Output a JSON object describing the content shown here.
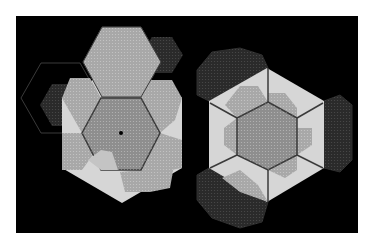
{
  "figure": {
    "background": "#ffffff",
    "panel": {
      "x": 16,
      "y": 16,
      "width": 342,
      "height": 217,
      "color": "#000000"
    },
    "colors": {
      "light_region": "#d6d6d6",
      "mid_gray": "#8e8e8e",
      "mid_gray_light": "#a8a8a8",
      "dark_gray": "#5a5a5a",
      "faint_dark": "#2a2a2a",
      "outline": "#3a3a3a",
      "outline_dark": "#2e2e2e",
      "dot": "#000000"
    },
    "left_diagram": {
      "big_hex": "122,63 182,98 182,168 122,203 62,168 62,98",
      "center_dot": {
        "cx": 121,
        "cy": 133,
        "r": 2
      },
      "inner_hex": "82,133 101,98 141,98 160,133 141,170 101,170",
      "outline_hexes": [
        "21,98 41,63 80,63 100,98 80,133 41,133",
        "83,62 102,27 141,27 161,62 141,97 102,97"
      ],
      "faint_hexes": [
        "40,105 52,84 74,84 86,105 74,126 52,126",
        "101,55 112,37 133,37 144,55 133,73 112,73",
        "140,55 152,37 172,37 183,55 172,73 152,73"
      ],
      "mid_hexes": [
        "83,62 102,97 141,97 161,62 141,27 102,27",
        "62,98 82,133 101,98 90,78 70,78",
        "141,98 160,133 175,120 182,98 172,80 150,80",
        "62,133 82,133 95,152 82,170 62,170",
        "160,133 182,140 182,168 160,172 145,155",
        "120,172 141,170 160,140 175,160 170,188 150,192 125,192"
      ],
      "light_patch": "88,160 101,150 112,152 118,170 101,170"
    },
    "right_diagram": {
      "big_hex": "267,68 324,101 324,168 267,202 209,168 209,101",
      "inner_hex": "268,102 297,118 297,155 268,170 237,155 237,118",
      "spokes": [
        {
          "x1": 268,
          "y1": 102,
          "x2": 268,
          "y2": 68
        },
        {
          "x1": 237,
          "y1": 118,
          "x2": 210,
          "y2": 103
        },
        {
          "x1": 297,
          "y1": 118,
          "x2": 323,
          "y2": 103
        },
        {
          "x1": 268,
          "y1": 170,
          "x2": 268,
          "y2": 202
        },
        {
          "x1": 237,
          "y1": 155,
          "x2": 210,
          "y2": 168
        },
        {
          "x1": 297,
          "y1": 155,
          "x2": 323,
          "y2": 168
        }
      ],
      "mid_hexes": [
        "268,93 285,93 297,108 297,118 268,102",
        "224,128 237,118 237,155 224,145",
        "297,128 312,128 312,145 297,155",
        "268,170 285,178 297,170 297,155",
        "240,86 258,86 268,102 237,118 225,105",
        "240,170 258,185 268,202 240,192 222,178"
      ],
      "faint_shapes": [
        "197,70 212,52 240,48 262,55 268,68 240,85 209,101 197,95",
        "324,101 340,95 352,105 352,160 340,172 324,168",
        "197,175 209,168 240,185 268,202 262,222 240,228 212,218 197,200"
      ]
    }
  }
}
